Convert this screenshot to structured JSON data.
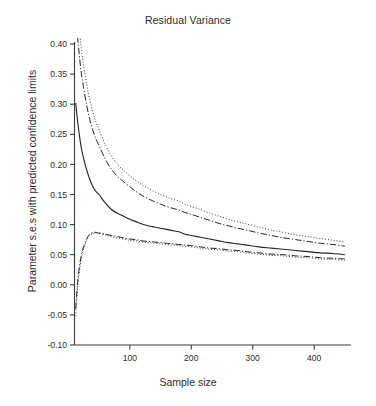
{
  "chart_data": {
    "type": "line",
    "title": "Residual Variance",
    "xlabel": "Sample size",
    "ylabel": "Parameter s.e.s with predicted confidence limits",
    "xlim": [
      10,
      455
    ],
    "ylim": [
      -0.1,
      0.4
    ],
    "xticks": [
      100,
      200,
      300,
      400
    ],
    "xtick_labels": [
      "100",
      "200",
      "300",
      "400"
    ],
    "yticks": [
      -0.1,
      -0.05,
      0.0,
      0.05,
      0.1,
      0.15,
      0.2,
      0.25,
      0.3,
      0.35,
      0.4
    ],
    "ytick_labels": [
      "-0.10",
      "-0.05",
      "0.00",
      "0.05",
      "0.10",
      "0.15",
      "0.20",
      "0.25",
      "0.30",
      "0.35",
      "0.40"
    ],
    "grid": false,
    "legend": "none",
    "line_color": "#262626",
    "x": [
      12,
      15,
      18,
      21,
      25,
      30,
      35,
      40,
      45,
      50,
      60,
      70,
      80,
      90,
      100,
      110,
      120,
      130,
      140,
      150,
      160,
      170,
      180,
      190,
      200,
      215,
      230,
      245,
      260,
      275,
      290,
      310,
      330,
      350,
      370,
      390,
      410,
      430,
      450
    ],
    "series": [
      {
        "name": "Parameter s.e. (empirical)",
        "style": "solid",
        "values": [
          0.302,
          0.272,
          0.248,
          0.228,
          0.209,
          0.19,
          0.175,
          0.163,
          0.155,
          0.15,
          0.136,
          0.125,
          0.119,
          0.114,
          0.109,
          0.105,
          0.101,
          0.098,
          0.096,
          0.094,
          0.092,
          0.09,
          0.088,
          0.084,
          0.082,
          0.079,
          0.076,
          0.073,
          0.07,
          0.068,
          0.066,
          0.063,
          0.061,
          0.059,
          0.057,
          0.055,
          0.053,
          0.052,
          0.05
        ]
      },
      {
        "name": "Upper confidence limit (dash-dot)",
        "style": "dashdot",
        "values": [
          0.452,
          0.412,
          0.38,
          0.352,
          0.326,
          0.297,
          0.274,
          0.256,
          0.242,
          0.231,
          0.209,
          0.192,
          0.18,
          0.171,
          0.163,
          0.155,
          0.148,
          0.143,
          0.138,
          0.134,
          0.13,
          0.127,
          0.124,
          0.12,
          0.117,
          0.112,
          0.107,
          0.102,
          0.098,
          0.094,
          0.091,
          0.086,
          0.082,
          0.078,
          0.075,
          0.072,
          0.069,
          0.067,
          0.064
        ]
      },
      {
        "name": "Upper confidence limit (dotted)",
        "style": "dotted",
        "values": [
          0.5,
          0.458,
          0.424,
          0.394,
          0.364,
          0.332,
          0.306,
          0.286,
          0.27,
          0.257,
          0.233,
          0.214,
          0.2,
          0.19,
          0.181,
          0.173,
          0.166,
          0.16,
          0.155,
          0.15,
          0.146,
          0.142,
          0.139,
          0.134,
          0.13,
          0.125,
          0.119,
          0.114,
          0.109,
          0.105,
          0.101,
          0.096,
          0.091,
          0.087,
          0.083,
          0.08,
          0.077,
          0.074,
          0.071
        ]
      },
      {
        "name": "Lower confidence limit (dash-dot)",
        "style": "dashdot",
        "values": [
          -0.04,
          0.004,
          0.03,
          0.048,
          0.064,
          0.077,
          0.084,
          0.087,
          0.087,
          0.086,
          0.084,
          0.082,
          0.08,
          0.078,
          0.076,
          0.075,
          0.073,
          0.072,
          0.071,
          0.07,
          0.069,
          0.068,
          0.067,
          0.066,
          0.065,
          0.063,
          0.061,
          0.06,
          0.058,
          0.057,
          0.055,
          0.053,
          0.051,
          0.05,
          0.048,
          0.047,
          0.045,
          0.044,
          0.043
        ]
      },
      {
        "name": "Lower confidence limit (dotted)",
        "style": "dotted",
        "values": [
          -0.052,
          -0.006,
          0.022,
          0.042,
          0.06,
          0.074,
          0.082,
          0.085,
          0.086,
          0.085,
          0.083,
          0.08,
          0.078,
          0.076,
          0.074,
          0.073,
          0.071,
          0.07,
          0.069,
          0.068,
          0.067,
          0.066,
          0.065,
          0.064,
          0.063,
          0.061,
          0.059,
          0.058,
          0.056,
          0.055,
          0.053,
          0.051,
          0.049,
          0.048,
          0.046,
          0.045,
          0.043,
          0.042,
          0.041
        ]
      }
    ]
  }
}
